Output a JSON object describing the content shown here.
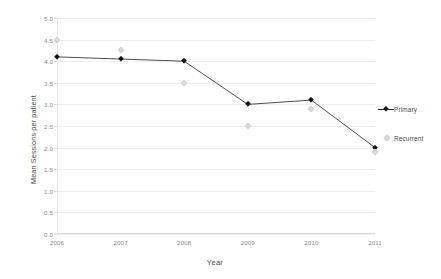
{
  "chart_data": {
    "type": "line",
    "title": "",
    "xlabel": "Year",
    "ylabel": "Mean Sessions per patient",
    "categories": [
      "2006",
      "2007",
      "2008",
      "2009",
      "2010",
      "2011"
    ],
    "x": [
      2006,
      2007,
      2008,
      2009,
      2010,
      2011
    ],
    "ylim": [
      0.0,
      5.0
    ],
    "ytick_step": 0.5,
    "ytick_labels": [
      "0.0",
      "0.5",
      "1.0",
      "1.5",
      "2.0",
      "2.5",
      "3.0",
      "3.5",
      "4.0",
      "4.5",
      "5.0"
    ],
    "ytick_values": [
      0.0,
      0.5,
      1.0,
      1.5,
      2.0,
      2.5,
      3.0,
      3.5,
      4.0,
      4.5,
      5.0
    ],
    "grid": true,
    "grid_axis": "y",
    "legend_position": "right",
    "series": [
      {
        "name": "Primary",
        "marker": "diamond",
        "color": "#111111",
        "line": true,
        "values": [
          4.1,
          4.05,
          4.0,
          3.0,
          3.1,
          2.0
        ]
      },
      {
        "name": "Recurrent",
        "marker": "diamond",
        "color": "#dcdcdf",
        "line": false,
        "values": [
          4.5,
          4.25,
          3.5,
          2.5,
          2.9,
          1.9
        ]
      }
    ]
  },
  "legend": {
    "items": [
      {
        "label": "Primary"
      },
      {
        "label": "Recurrent"
      }
    ]
  }
}
